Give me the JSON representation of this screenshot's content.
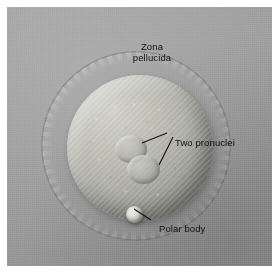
{
  "figure": {
    "type": "light-micrograph",
    "technique": "differential interference contrast",
    "background_color": "#9d9d9d",
    "label_color": "#111111",
    "plate": {
      "x": 7,
      "y": 7,
      "width": 265,
      "height": 259
    }
  },
  "labels": [
    {
      "id": "zona",
      "name": "zona-pellucida-label",
      "line1": "Zona",
      "line2": "pellucida",
      "x": 112,
      "y": 34,
      "leader": "none"
    },
    {
      "id": "pronuclei",
      "name": "two-pronuclei-label",
      "text": "Two pronuclei",
      "x": 168,
      "y": 130,
      "leader": "two-branch-left"
    },
    {
      "id": "polar",
      "name": "polar-body-label",
      "text": "Polar body",
      "x": 152,
      "y": 216,
      "leader": "single-up-left"
    }
  ],
  "structures": [
    {
      "id": "zona",
      "name": "zona-pellucida",
      "label": "Zona pellucida",
      "center_x": 129,
      "center_y": 139,
      "outer_radius": 95,
      "inner_radius": 73,
      "appearance": "granular translucent halo encircling the oocyte"
    },
    {
      "id": "ooplasm",
      "name": "ooplasm",
      "label": "Ooplasm",
      "center_x": 133,
      "center_y": 141,
      "radius": 73,
      "appearance": "granular cytoplasm, illuminated from upper left"
    },
    {
      "id": "pronucleus-1",
      "name": "pronucleus-maternal",
      "label": "Pronucleus",
      "center_x": 124,
      "center_y": 142,
      "radius_x": 16,
      "radius_y": 14
    },
    {
      "id": "pronucleus-2",
      "name": "pronucleus-paternal",
      "label": "Pronucleus",
      "center_x": 136,
      "center_y": 162,
      "radius_x": 16,
      "radius_y": 14
    },
    {
      "id": "polar-body",
      "name": "polar-body",
      "label": "Polar body",
      "center_x": 127,
      "center_y": 207,
      "radius": 8,
      "appearance": "small bright refractile sphere at the oocyte margin"
    }
  ]
}
